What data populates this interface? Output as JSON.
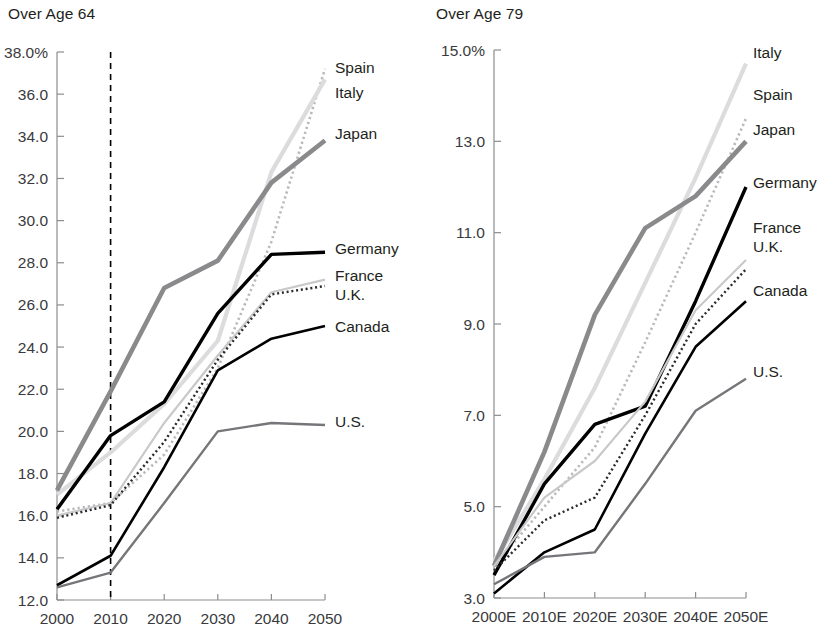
{
  "charts": [
    {
      "id": "over-age-64",
      "title": "Over Age 64",
      "axis": {
        "ylabels": [
          "38.0%",
          "36.0",
          "34.0",
          "32.0",
          "30.0",
          "28.0",
          "26.0",
          "24.0",
          "22.0",
          "20.0",
          "18.0",
          "16.0",
          "14.0",
          "12.0"
        ],
        "xlabels": [
          "2000",
          "2010",
          "2020",
          "2030",
          "2040",
          "2050"
        ]
      },
      "series_labels": [
        "Spain",
        "Italy",
        "Japan",
        "Germany",
        "France",
        "U.K.",
        "Canada",
        "U.S."
      ]
    },
    {
      "id": "over-age-79",
      "title": "Over Age 79",
      "axis": {
        "ylabels": [
          "15.0%",
          "13.0",
          "11.0",
          "9.0",
          "7.0",
          "5.0",
          "3.0"
        ],
        "xlabels": [
          "2000E",
          "2010E",
          "2020E",
          "2030E",
          "2040E",
          "2050E"
        ]
      },
      "series_labels": [
        "Italy",
        "Spain",
        "Japan",
        "Germany",
        "France",
        "U.K.",
        "Canada",
        "U.S."
      ]
    }
  ],
  "chart_data": [
    {
      "type": "line",
      "title": "Over Age 64",
      "xlabel": "",
      "ylabel": "",
      "x": [
        2000,
        2010,
        2020,
        2030,
        2040,
        2050
      ],
      "xticklabels": [
        "2000",
        "2010",
        "2020",
        "2030",
        "2040",
        "2050"
      ],
      "ylim": [
        12.0,
        38.0
      ],
      "ytick": [
        12.0,
        14.0,
        16.0,
        18.0,
        20.0,
        22.0,
        24.0,
        26.0,
        28.0,
        30.0,
        32.0,
        34.0,
        36.0,
        38.0
      ],
      "yticklabels": [
        "12.0",
        "14.0",
        "16.0",
        "18.0",
        "20.0",
        "22.0",
        "24.0",
        "26.0",
        "28.0",
        "30.0",
        "32.0",
        "34.0",
        "36.0",
        "38.0%"
      ],
      "grid": false,
      "legend": "right-inline-at-line-ends",
      "annotations": [
        {
          "type": "vertical-dashed-line",
          "x": 2010,
          "label": ""
        }
      ],
      "series": [
        {
          "name": "Spain",
          "style": "dotted",
          "color": "#b9b9bb",
          "width": 2.6,
          "values": [
            16.2,
            16.6,
            18.9,
            23.0,
            29.0,
            37.2
          ]
        },
        {
          "name": "Italy",
          "style": "solid",
          "color": "#dcdcde",
          "width": 4.2,
          "values": [
            17.0,
            19.0,
            21.3,
            24.3,
            32.3,
            36.7
          ]
        },
        {
          "name": "Japan",
          "style": "solid",
          "color": "#8a8a8c",
          "width": 4.6,
          "values": [
            17.2,
            21.9,
            26.8,
            28.1,
            31.8,
            33.8
          ]
        },
        {
          "name": "Germany",
          "style": "solid",
          "color": "#000000",
          "width": 3.4,
          "values": [
            16.3,
            19.8,
            21.4,
            25.6,
            28.4,
            28.5
          ]
        },
        {
          "name": "France",
          "style": "solid",
          "color": "#c9c9cb",
          "width": 2.2,
          "values": [
            16.0,
            16.6,
            20.4,
            23.6,
            26.6,
            27.2
          ]
        },
        {
          "name": "U.K.",
          "style": "dotted",
          "color": "#2b2b2d",
          "width": 2.4,
          "values": [
            15.9,
            16.5,
            19.5,
            23.4,
            26.5,
            26.9
          ]
        },
        {
          "name": "Canada",
          "style": "solid",
          "color": "#000000",
          "width": 2.6,
          "values": [
            12.7,
            14.1,
            18.3,
            22.9,
            24.4,
            25.0
          ]
        },
        {
          "name": "U.S.",
          "style": "solid",
          "color": "#76767a",
          "width": 2.4,
          "values": [
            12.6,
            13.3,
            16.6,
            20.0,
            20.4,
            20.3
          ]
        }
      ]
    },
    {
      "type": "line",
      "title": "Over Age 79",
      "xlabel": "",
      "ylabel": "",
      "x": [
        2000,
        2010,
        2020,
        2030,
        2040,
        2050
      ],
      "xticklabels": [
        "2000E",
        "2010E",
        "2020E",
        "2030E",
        "2040E",
        "2050E"
      ],
      "ylim": [
        3.0,
        15.0
      ],
      "ytick": [
        3.0,
        5.0,
        7.0,
        9.0,
        11.0,
        13.0,
        15.0
      ],
      "yticklabels": [
        "3.0",
        "5.0",
        "7.0",
        "9.0",
        "11.0",
        "13.0",
        "15.0%"
      ],
      "grid": false,
      "legend": "right-inline-at-line-ends",
      "annotations": [],
      "series": [
        {
          "name": "Italy",
          "style": "solid",
          "color": "#dcdcde",
          "width": 4.2,
          "values": [
            3.8,
            5.6,
            7.6,
            9.9,
            12.2,
            14.7
          ]
        },
        {
          "name": "Spain",
          "style": "dotted",
          "color": "#b9b9bb",
          "width": 2.6,
          "values": [
            3.7,
            5.0,
            6.3,
            8.6,
            11.0,
            13.5
          ]
        },
        {
          "name": "Japan",
          "style": "solid",
          "color": "#8a8a8c",
          "width": 4.6,
          "values": [
            3.7,
            6.2,
            9.2,
            11.1,
            11.8,
            13.0
          ]
        },
        {
          "name": "Germany",
          "style": "solid",
          "color": "#000000",
          "width": 3.4,
          "values": [
            3.5,
            5.5,
            6.8,
            7.2,
            9.5,
            12.0
          ]
        },
        {
          "name": "France",
          "style": "solid",
          "color": "#c9c9cb",
          "width": 2.2,
          "values": [
            3.7,
            5.2,
            6.0,
            7.3,
            9.3,
            10.4
          ]
        },
        {
          "name": "U.K.",
          "style": "dotted",
          "color": "#2b2b2d",
          "width": 2.4,
          "values": [
            3.6,
            4.7,
            5.2,
            7.0,
            9.0,
            10.2
          ]
        },
        {
          "name": "Canada",
          "style": "solid",
          "color": "#000000",
          "width": 2.6,
          "values": [
            3.1,
            4.0,
            4.5,
            6.6,
            8.5,
            9.5
          ]
        },
        {
          "name": "U.S.",
          "style": "solid",
          "color": "#76767a",
          "width": 2.4,
          "values": [
            3.3,
            3.9,
            4.0,
            5.5,
            7.1,
            7.8
          ]
        }
      ]
    }
  ],
  "label_positions": {
    "over-age-64": [
      {
        "name": "Spain",
        "x": 335,
        "y": 73
      },
      {
        "name": "Italy",
        "x": 335,
        "y": 98
      },
      {
        "name": "Japan",
        "x": 335,
        "y": 139
      },
      {
        "name": "Germany",
        "x": 335,
        "y": 254
      },
      {
        "name": "France",
        "x": 335,
        "y": 281
      },
      {
        "name": "U.K.",
        "x": 335,
        "y": 300
      },
      {
        "name": "Canada",
        "x": 335,
        "y": 332
      },
      {
        "name": "U.S.",
        "x": 335,
        "y": 427
      }
    ],
    "over-age-79": [
      {
        "name": "Italy",
        "x": 340,
        "y": 58
      },
      {
        "name": "Spain",
        "x": 340,
        "y": 100
      },
      {
        "name": "Japan",
        "x": 340,
        "y": 135
      },
      {
        "name": "Germany",
        "x": 340,
        "y": 188
      },
      {
        "name": "France",
        "x": 340,
        "y": 233
      },
      {
        "name": "U.K.",
        "x": 340,
        "y": 252
      },
      {
        "name": "Canada",
        "x": 340,
        "y": 296
      },
      {
        "name": "U.S.",
        "x": 340,
        "y": 377
      }
    ]
  }
}
